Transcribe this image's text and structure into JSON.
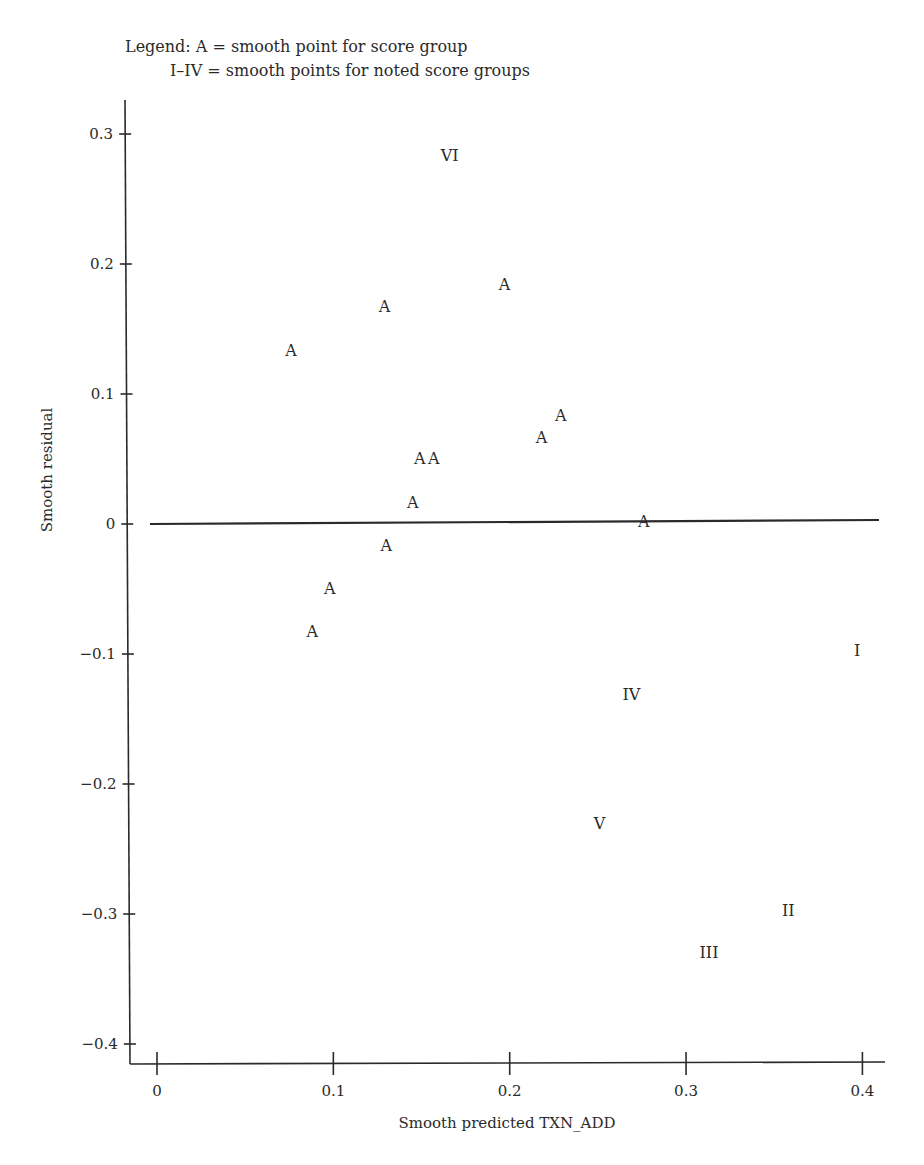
{
  "legend": {
    "line1": "Legend: A = smooth point for score group",
    "line2": "I–IV = smooth points for noted score groups"
  },
  "chart_data": {
    "type": "scatter",
    "title": "",
    "xlabel": "Smooth predicted TXN_ADD",
    "ylabel": "Smooth residual",
    "xlim": [
      -0.015,
      0.415
    ],
    "ylim": [
      -0.417,
      0.327
    ],
    "grid": false,
    "legend_position": "top-left (text above plot)",
    "xticks": [
      0,
      0.1,
      0.2,
      0.3,
      0.4
    ],
    "xtick_labels": [
      "0",
      "0.1",
      "0.2",
      "0.3",
      "0.4"
    ],
    "yticks": [
      0.3,
      0.2,
      0.1,
      0,
      -0.1,
      -0.2,
      -0.3,
      -0.4
    ],
    "ytick_labels": [
      "0.3",
      "0.2",
      "0.1",
      "0",
      "−0.1",
      "−0.2",
      "−0.3",
      "−0.4"
    ],
    "reference_line": {
      "y": 0,
      "x_start": -0.004,
      "x_end": 0.41
    },
    "series": [
      {
        "name": "A = smooth point for score group",
        "marker": "A",
        "points": [
          {
            "x": 0.197,
            "y": 0.185
          },
          {
            "x": 0.129,
            "y": 0.168
          },
          {
            "x": 0.076,
            "y": 0.134
          },
          {
            "x": 0.229,
            "y": 0.084
          },
          {
            "x": 0.218,
            "y": 0.067
          },
          {
            "x": 0.149,
            "y": 0.051
          },
          {
            "x": 0.157,
            "y": 0.051
          },
          {
            "x": 0.145,
            "y": 0.017
          },
          {
            "x": 0.276,
            "y": 0.002
          },
          {
            "x": 0.13,
            "y": -0.016
          },
          {
            "x": 0.098,
            "y": -0.049
          },
          {
            "x": 0.088,
            "y": -0.082
          }
        ]
      },
      {
        "name": "I–IV = smooth points for noted score groups",
        "points": [
          {
            "label": "I",
            "x": 0.397,
            "y": -0.097
          },
          {
            "label": "II",
            "x": 0.358,
            "y": -0.297
          },
          {
            "label": "III",
            "x": 0.313,
            "y": -0.329
          },
          {
            "label": "IV",
            "x": 0.269,
            "y": -0.131
          },
          {
            "label": "V",
            "x": 0.251,
            "y": -0.23
          },
          {
            "label": "VI",
            "x": 0.166,
            "y": 0.284
          }
        ]
      }
    ]
  }
}
